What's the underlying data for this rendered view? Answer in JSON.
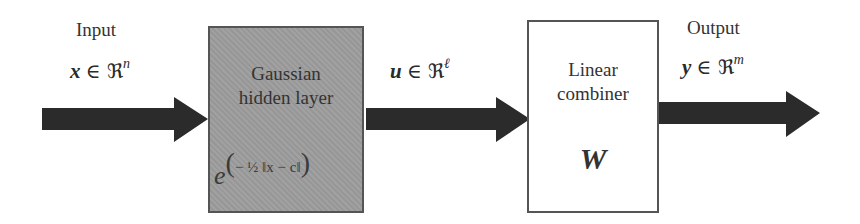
{
  "input": {
    "label": "Input",
    "var": "x",
    "set_symbol": "∈ ℜ",
    "dim": "n"
  },
  "hidden_layer": {
    "title_line1": "Gaussian",
    "title_line2": "hidden layer",
    "formula_base": "e",
    "formula_open": "(",
    "formula_body": "− ½ ‖x − c‖",
    "formula_close": ")"
  },
  "intermediate": {
    "var": "u",
    "set_symbol": "∈ ℜ",
    "dim": "ℓ"
  },
  "combiner": {
    "title_line1": "Linear",
    "title_line2": "combiner",
    "weight_symbol": "W"
  },
  "output": {
    "label": "Output",
    "var": "y",
    "set_symbol": "∈ ℜ",
    "dim": "m"
  },
  "colors": {
    "arrow": "#2b2b2b",
    "hidden_box_fill": "#9d9d9d",
    "box_border": "#555555",
    "combiner_fill": "#ffffff"
  }
}
